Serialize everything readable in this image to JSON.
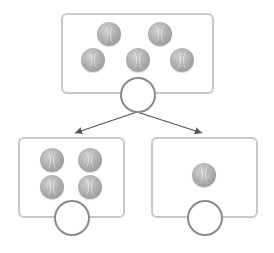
{
  "diagram": {
    "type": "number-bond",
    "whole": {
      "ball_count": 5,
      "answer": ""
    },
    "parts": [
      {
        "ball_count": 4,
        "answer": ""
      },
      {
        "ball_count": 1,
        "answer": ""
      }
    ],
    "icons": {
      "ball": "tennis-ball-icon",
      "answer": "blank-circle"
    },
    "colors": {
      "frame_border": "#c8c8c8",
      "circle_border": "#8a8a8a",
      "arrow": "#555555",
      "ball": "#a9a9a9"
    }
  }
}
